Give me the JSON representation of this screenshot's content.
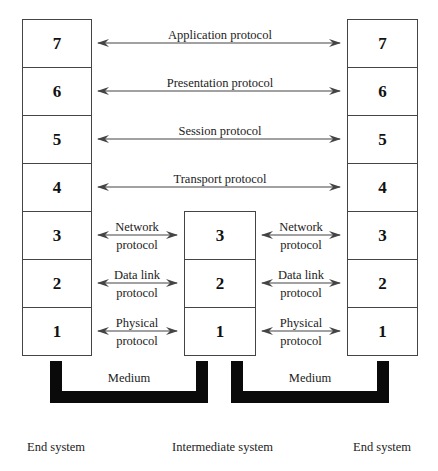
{
  "diagram": {
    "type": "OSI reference model with intermediate system",
    "left_stack": {
      "label": "End system",
      "layers": [
        "7",
        "6",
        "5",
        "4",
        "3",
        "2",
        "1"
      ]
    },
    "intermediate_stack": {
      "label": "Intermediate system",
      "layers": [
        "3",
        "2",
        "1"
      ]
    },
    "right_stack": {
      "label": "End system",
      "layers": [
        "7",
        "6",
        "5",
        "4",
        "3",
        "2",
        "1"
      ]
    },
    "peer_protocols_long": [
      {
        "layer": "7",
        "label": "Application protocol"
      },
      {
        "layer": "6",
        "label": "Presentation protocol"
      },
      {
        "layer": "5",
        "label": "Session protocol"
      },
      {
        "layer": "4",
        "label": "Transport protocol"
      }
    ],
    "peer_protocols_short": [
      {
        "layer": "3",
        "line1": "Network",
        "line2": "protocol"
      },
      {
        "layer": "2",
        "line1": "Data link",
        "line2": "protocol"
      },
      {
        "layer": "1",
        "line1": "Physical",
        "line2": "protocol"
      }
    ],
    "medium": {
      "left_label": "Medium",
      "right_label": "Medium"
    }
  }
}
